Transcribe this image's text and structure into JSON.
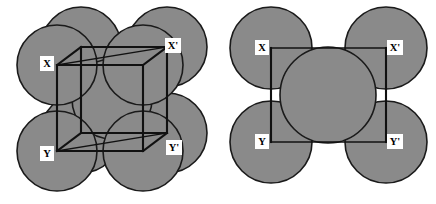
{
  "figure": {
    "background_color": "#ffffff",
    "sphere_fill_color": "#8a8a8a",
    "sphere_outline_color": "#1a1a1a",
    "cell_edge_color": "#111111",
    "label_text_color": "#000000",
    "label_box_color": "#ffffff",
    "width": 436,
    "height": 204
  },
  "panels": [
    {
      "id": "left",
      "name": "bcc-unit-cell-3d",
      "caption": "",
      "geometry_type": "cube",
      "labels": [
        {
          "id": "x",
          "text": "X",
          "x": 47,
          "y": 64
        },
        {
          "id": "xprime",
          "text": "X'",
          "x": 173,
          "y": 46
        },
        {
          "id": "y",
          "text": "Y",
          "x": 47,
          "y": 154
        },
        {
          "id": "yprime",
          "text": "Y'",
          "x": 174,
          "y": 148
        }
      ],
      "cube": {
        "front_face": {
          "x": 57,
          "y": 65,
          "w": 86,
          "h": 86
        },
        "back_face": {
          "x": 81,
          "y": 47,
          "w": 86,
          "h": 86
        },
        "depth_dx": 24,
        "depth_dy": -18
      },
      "spheres": [
        {
          "id": "corner-front-top-left",
          "cx": 57,
          "cy": 65,
          "r": 40
        },
        {
          "id": "corner-front-top-right",
          "cx": 143,
          "cy": 65,
          "r": 40
        },
        {
          "id": "corner-front-bottom-left",
          "cx": 57,
          "cy": 151,
          "r": 40
        },
        {
          "id": "corner-front-bottom-right",
          "cx": 143,
          "cy": 151,
          "r": 40
        },
        {
          "id": "corner-back-top-left",
          "cx": 81,
          "cy": 47,
          "r": 40
        },
        {
          "id": "corner-back-top-right",
          "cx": 167,
          "cy": 47,
          "r": 40
        },
        {
          "id": "corner-back-bottom-left",
          "cx": 81,
          "cy": 133,
          "r": 40
        },
        {
          "id": "corner-back-bottom-right",
          "cx": 167,
          "cy": 133,
          "r": 40
        },
        {
          "id": "body-centre",
          "cx": 112,
          "cy": 99,
          "r": 40
        }
      ]
    },
    {
      "id": "right",
      "name": "bcc-xxyy-section-2d",
      "caption": "",
      "geometry_type": "square",
      "labels": [
        {
          "id": "x",
          "text": "X",
          "x": 44,
          "y": 48
        },
        {
          "id": "xprime",
          "text": "X'",
          "x": 177,
          "y": 48
        },
        {
          "id": "y",
          "text": "Y",
          "x": 44,
          "y": 142
        },
        {
          "id": "yprime",
          "text": "Y'",
          "x": 177,
          "y": 142
        }
      ],
      "square": {
        "x": 53,
        "y": 48,
        "w": 115,
        "h": 94
      },
      "spheres": [
        {
          "id": "corner-top-left",
          "cx": 53,
          "cy": 48,
          "r": 41
        },
        {
          "id": "corner-top-right",
          "cx": 168,
          "cy": 48,
          "r": 41
        },
        {
          "id": "corner-bottom-left",
          "cx": 53,
          "cy": 142,
          "r": 41
        },
        {
          "id": "corner-bottom-right",
          "cx": 168,
          "cy": 142,
          "r": 41
        },
        {
          "id": "centre",
          "cx": 110,
          "cy": 95,
          "r": 48
        }
      ]
    }
  ]
}
